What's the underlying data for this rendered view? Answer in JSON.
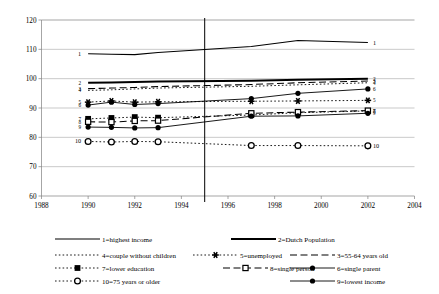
{
  "chart_data": {
    "type": "line",
    "title": "",
    "xlabel": "",
    "ylabel": "",
    "xlim": [
      1988,
      2004
    ],
    "ylim": [
      60,
      120
    ],
    "grid": true,
    "legend_position": "bottom",
    "x_ticks": [
      "1988",
      "1990",
      "1992",
      "1994",
      "1996",
      "1998",
      "2000",
      "2002",
      "2004"
    ],
    "y_ticks": [
      "60",
      "70",
      "80",
      "90",
      "100",
      "110",
      "120"
    ],
    "annotations": [
      {
        "name": "event-line",
        "x": 1995,
        "label": ""
      }
    ],
    "series": [
      {
        "id": 1,
        "name": "1=highest income",
        "style": "solid",
        "marker": "none",
        "width": "medium",
        "tag_left": "1",
        "tag_right": "1",
        "x": [
          1990,
          1991,
          1992,
          1993,
          1997,
          1999,
          2002
        ],
        "values": [
          108.5,
          108.3,
          108.2,
          108.9,
          111.0,
          113.0,
          112.3
        ]
      },
      {
        "id": 2,
        "name": "2=Dutch Population",
        "style": "solid",
        "marker": "none",
        "width": "thick",
        "tag_left": "2",
        "tag_right": "2",
        "x": [
          1990,
          1991,
          1992,
          1993,
          1997,
          1999,
          2002
        ],
        "values": [
          98.6,
          98.7,
          98.9,
          99.0,
          99.3,
          99.6,
          100.0
        ]
      },
      {
        "id": 3,
        "name": "3=55-64 years old",
        "style": "dashed",
        "marker": "none",
        "width": "medium",
        "tag_left": "3",
        "tag_right": "3",
        "x": [
          1990,
          1991,
          1992,
          1993,
          1997,
          1999,
          2002
        ],
        "values": [
          96.6,
          96.8,
          97.0,
          97.3,
          98.0,
          98.6,
          99.2
        ]
      },
      {
        "id": 4,
        "name": "4=couple without children",
        "style": "dotted",
        "marker": "none",
        "width": "thin",
        "tag_left": "4",
        "tag_right": "4",
        "x": [
          1990,
          1991,
          1992,
          1993,
          1997,
          1999,
          2002
        ],
        "values": [
          96.0,
          96.2,
          96.5,
          96.8,
          97.4,
          97.9,
          98.6
        ]
      },
      {
        "id": 5,
        "name": "5=unemployed",
        "style": "dotted",
        "marker": "asterisk",
        "width": "thin",
        "tag_left": "5",
        "tag_right": "5",
        "x": [
          1990,
          1991,
          1992,
          1993,
          1997,
          1999,
          2002
        ],
        "values": [
          92.0,
          92.4,
          92.0,
          92.1,
          92.3,
          92.4,
          92.6
        ]
      },
      {
        "id": 6,
        "name": "6=single parent",
        "style": "solid",
        "marker": "filled-circle",
        "width": "thin",
        "tag_left": "6",
        "tag_right": "6",
        "x": [
          1990,
          1991,
          1992,
          1993,
          1997,
          1999,
          2002
        ],
        "values": [
          91.0,
          92.0,
          91.2,
          91.5,
          93.2,
          95.0,
          96.5
        ]
      },
      {
        "id": 7,
        "name": "7=lower education",
        "style": "dotted",
        "marker": "filled-square",
        "width": "thin",
        "tag_left": "7",
        "tag_right": "7",
        "x": [
          1990,
          1991,
          1992,
          1993,
          1997,
          1999,
          2002
        ],
        "values": [
          86.3,
          86.6,
          86.9,
          86.7,
          87.6,
          88.4,
          89.0
        ]
      },
      {
        "id": 8,
        "name": "8=single person",
        "style": "dashed",
        "marker": "open-square",
        "width": "medium",
        "tag_left": "8",
        "tag_right": "8",
        "x": [
          1990,
          1991,
          1992,
          1993,
          1997,
          1999,
          2002
        ],
        "values": [
          85.3,
          85.2,
          85.6,
          85.7,
          88.2,
          88.6,
          89.1
        ]
      },
      {
        "id": 9,
        "name": "9=lowest income",
        "style": "solid",
        "marker": "filled-circle",
        "width": "thin",
        "tag_left": "9",
        "tag_right": "9",
        "x": [
          1990,
          1991,
          1992,
          1993,
          1997,
          1999,
          2002
        ],
        "values": [
          83.5,
          83.4,
          83.2,
          83.3,
          87.2,
          87.3,
          88.2
        ]
      },
      {
        "id": 10,
        "name": "10=75 years or older",
        "style": "dotted",
        "marker": "open-circle",
        "width": "thin",
        "tag_left": "10",
        "tag_right": "10",
        "x": [
          1990,
          1991,
          1992,
          1993,
          1997,
          1999,
          2002
        ],
        "values": [
          78.6,
          78.4,
          78.6,
          78.5,
          77.2,
          77.2,
          77.1
        ]
      }
    ]
  },
  "legend": {
    "items": [
      {
        "key": "1",
        "label": "1=highest income"
      },
      {
        "key": "2",
        "label": "2=Dutch Population"
      },
      {
        "key": "3",
        "label": "3=55-64 years old"
      },
      {
        "key": "4",
        "label": "4=couple without children"
      },
      {
        "key": "5",
        "label": "5=unemployed"
      },
      {
        "key": "6",
        "label": "6=single parent"
      },
      {
        "key": "7",
        "label": "7=lower education"
      },
      {
        "key": "8",
        "label": "8=single person"
      },
      {
        "key": "9",
        "label": "9=lowest income"
      },
      {
        "key": "10",
        "label": "10=75 years or older"
      }
    ]
  }
}
